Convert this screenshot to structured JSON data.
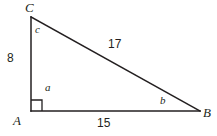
{
  "figure": {
    "type": "right-triangle-diagram",
    "background_color": "#ffffff",
    "stroke_color": "#231f20",
    "text_color": "#231f20",
    "stroke_width": 1.5,
    "vertices": {
      "C": {
        "label": "C",
        "x": 31,
        "y": 17
      },
      "A": {
        "label": "A",
        "x": 31,
        "y": 111
      },
      "B": {
        "label": "B",
        "x": 200,
        "y": 111
      }
    },
    "angles": {
      "at_C": {
        "label": "c",
        "x": 35,
        "y": 24
      },
      "at_A": {
        "label": "a",
        "x": 45,
        "y": 82,
        "is_right_angle": true
      },
      "at_B": {
        "label": "b",
        "x": 160,
        "y": 95
      }
    },
    "sides": {
      "AC": {
        "label": "8",
        "x": 7,
        "y": 52
      },
      "CB": {
        "label": "17",
        "x": 108,
        "y": 38
      },
      "AB": {
        "label": "15",
        "x": 97,
        "y": 117
      }
    },
    "right_angle_marker": {
      "name": "right-angle-square",
      "x": 31,
      "y": 111,
      "size": 11
    }
  }
}
